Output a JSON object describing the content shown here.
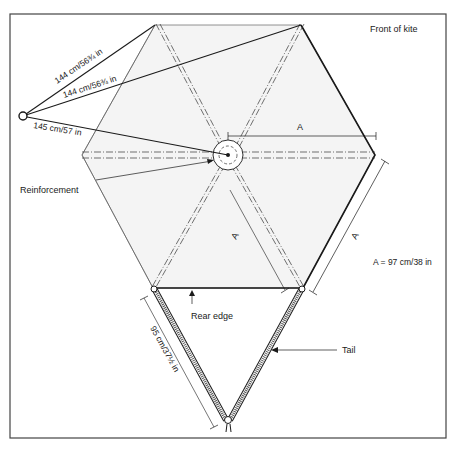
{
  "title": "Front of kite",
  "labels": {
    "bridle_line_1": "144 cm/56¾ in",
    "bridle_line_2": "144 cm/56¾ in",
    "bridle_line_3": "145 cm/57 in",
    "reinforcement": "Reinforcement",
    "dimension_a_top": "A",
    "dimension_a_side": "A",
    "dimension_a_inner": "A",
    "a_value": "A = 97 cm/38 in",
    "rear_edge": "Rear edge",
    "tail": "Tail",
    "tail_length": "95 cm/37½ in"
  },
  "colors": {
    "ink": "#1a1a1a",
    "sail_fill": "#f4f4f4",
    "frame": "#444444"
  }
}
